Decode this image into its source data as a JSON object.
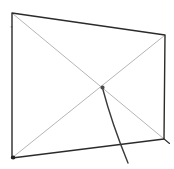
{
  "figure": {
    "background": "#ffffff",
    "colors": {
      "outline": "#2b2b2b",
      "diagonals": "#b6b6b6",
      "stand_line": "#3a3a3a",
      "center_dot": "#4a4a4a",
      "corner_blob": "#222222"
    },
    "paths": {
      "screen_outline": "M12,13 L165,35 L164,139 L12,158 Z",
      "diagonal_tl_br": "M12.5,13.5 L163.5,138.5",
      "diagonal_tr_bl": "M164.5,35.5 L12.5,157.5",
      "stand_line": "M102.5,88 Q112,124 128,163",
      "corner_tail": "M163.5,138.5 L169.5,143.5",
      "center_dot": "M100.4,87.5 a2.1,2.1 0 1,0 4.2,0 a2.1,2.1 0 1,0 -4.2,0",
      "bottom_left_blob": "M10.8,157.4 a2.3,2 0 1,0 4.6,0 a2.3,2 0 1,0 -4.6,0",
      "left_edge_speck": "M10.7,26.8 a0.9,0.9 0 1,0 1.8,0 a0.9,0.9 0 1,0 -1.8,0"
    }
  }
}
